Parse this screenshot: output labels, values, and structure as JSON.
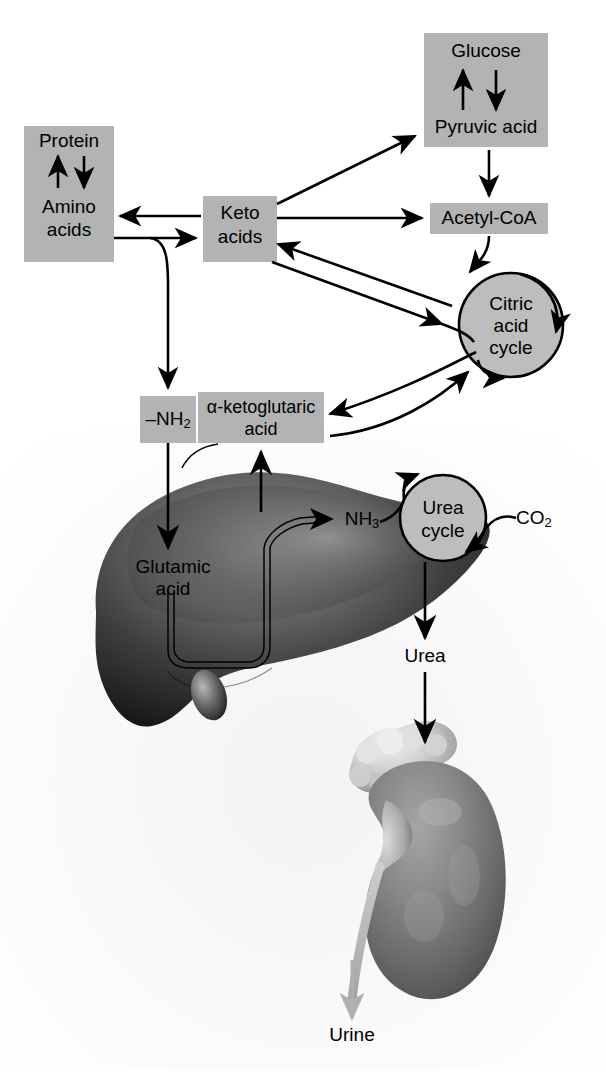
{
  "figure": {
    "background_color": "#ffffff",
    "box_fill_color": "#b3b3b3",
    "circle_fill_color": "#bdbdbd",
    "line_color": "#000000",
    "urine_arrow_color": "#b0b0b0"
  },
  "nodes": {
    "protein_amino": {
      "line1": "Protein",
      "line2": "Amino",
      "line3": "acids",
      "shape": "box"
    },
    "keto_acids": {
      "line1": "Keto",
      "line2": "acids",
      "shape": "box"
    },
    "glucose_pyruvic": {
      "line1": "Glucose",
      "line2": "Pyruvic acid",
      "shape": "box"
    },
    "acetyl_coa": {
      "label": "Acetyl-CoA",
      "shape": "box"
    },
    "citric_acid_cycle": {
      "line1": "Citric",
      "line2": "acid",
      "line3": "cycle",
      "shape": "circle"
    },
    "nh2": {
      "label": "–NH",
      "subscript": "2",
      "shape": "box"
    },
    "alpha_ketoglutaric": {
      "line1": "α-ketoglutaric",
      "line2": "acid",
      "shape": "box"
    },
    "glutamic_acid": {
      "line1": "Glutamic",
      "line2": "acid",
      "shape": "text"
    },
    "nh3": {
      "label": "NH",
      "subscript": "3",
      "shape": "text"
    },
    "urea_cycle": {
      "line1": "Urea",
      "line2": "cycle",
      "shape": "circle"
    },
    "co2": {
      "label": "CO",
      "subscript": "2",
      "shape": "text"
    },
    "urea": {
      "label": "Urea",
      "shape": "text"
    },
    "urine": {
      "label": "Urine",
      "shape": "text"
    }
  },
  "organs": {
    "liver": {
      "name": "liver"
    },
    "kidney": {
      "name": "kidney"
    }
  },
  "flows": [
    {
      "from": "protein",
      "to": "amino_acids",
      "type": "bidirectional"
    },
    {
      "from": "keto_acids",
      "to": "amino_acids",
      "type": "arrow"
    },
    {
      "from": "amino_acids",
      "to": "keto_acids",
      "type": "arrow"
    },
    {
      "from": "keto_acids",
      "to": "pyruvic_acid",
      "type": "arrow"
    },
    {
      "from": "keto_acids",
      "to": "acetyl_coa",
      "type": "arrow"
    },
    {
      "from": "glucose",
      "to": "pyruvic_acid",
      "type": "bidirectional"
    },
    {
      "from": "pyruvic_acid",
      "to": "acetyl_coa",
      "type": "arrow"
    },
    {
      "from": "acetyl_coa",
      "to": "citric_acid_cycle",
      "type": "arrow"
    },
    {
      "from": "keto_acids",
      "to": "citric_acid_cycle",
      "type": "bidirectional"
    },
    {
      "from": "alpha_ketoglutaric_acid",
      "to": "citric_acid_cycle",
      "type": "bidirectional"
    },
    {
      "from": "amino_acids",
      "to": "nh2",
      "type": "arrow"
    },
    {
      "from": "nh2",
      "to": "glutamic_acid",
      "type": "arrow"
    },
    {
      "from": "glutamic_acid",
      "to": "nh3",
      "type": "arrow"
    },
    {
      "from": "glutamic_acid",
      "to": "alpha_ketoglutaric_acid",
      "type": "arrow"
    },
    {
      "from": "nh3",
      "to": "urea_cycle",
      "type": "arrow"
    },
    {
      "from": "co2",
      "to": "urea_cycle",
      "type": "arrow"
    },
    {
      "from": "urea_cycle",
      "to": "urea",
      "type": "arrow"
    },
    {
      "from": "urea",
      "to": "kidney",
      "type": "arrow"
    },
    {
      "from": "kidney",
      "to": "urine",
      "type": "arrow"
    }
  ]
}
